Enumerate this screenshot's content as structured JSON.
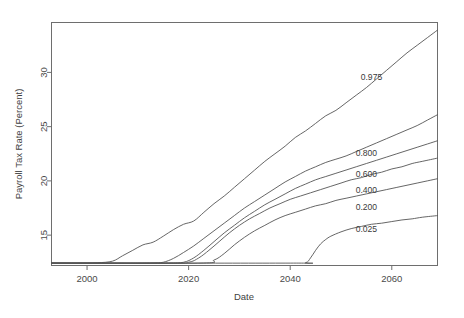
{
  "chart_data": {
    "type": "line",
    "title": "",
    "xlabel": "Date",
    "ylabel": "Payroll Tax Rate (Percent)",
    "xlim": [
      1993,
      2069
    ],
    "ylim": [
      12.2,
      34.6
    ],
    "xticks": [
      2000,
      2020,
      2040,
      2060
    ],
    "xticklabels": [
      "2000",
      "2020",
      "2040",
      "2060"
    ],
    "yticks": [
      15,
      20,
      25,
      30
    ],
    "yticklabels": [
      "15",
      "20",
      "25",
      "30"
    ],
    "grid": false,
    "legend": "inline-curve-labels",
    "series": [
      {
        "name": "0.975",
        "label": "0.975",
        "label_x": 2056,
        "label_y": 29.3,
        "x": [
          1993,
          1998,
          2002,
          2005,
          2007,
          2009,
          2011,
          2013,
          2015,
          2017,
          2019,
          2021,
          2023,
          2025,
          2027,
          2029,
          2031,
          2033,
          2035,
          2037,
          2039,
          2041,
          2043,
          2045,
          2047,
          2049,
          2051,
          2053,
          2055,
          2057,
          2059,
          2061,
          2063,
          2065,
          2067,
          2069
        ],
        "y": [
          12.42,
          12.42,
          12.45,
          12.6,
          13.1,
          13.6,
          14.1,
          14.35,
          14.9,
          15.5,
          16.0,
          16.3,
          17.1,
          17.9,
          18.6,
          19.4,
          20.2,
          21.0,
          21.8,
          22.5,
          23.2,
          24.0,
          24.6,
          25.3,
          26.0,
          26.5,
          27.2,
          27.9,
          28.6,
          29.4,
          30.2,
          31.0,
          31.8,
          32.5,
          33.2,
          33.9
        ]
      },
      {
        "name": "0.800",
        "label": "0.800",
        "label_x": 2055,
        "label_y": 22.3,
        "x": [
          1993,
          2005,
          2010,
          2013,
          2015,
          2017,
          2019,
          2021,
          2023,
          2025,
          2027,
          2029,
          2031,
          2033,
          2035,
          2037,
          2039,
          2041,
          2043,
          2045,
          2047,
          2049,
          2051,
          2053,
          2055,
          2057,
          2059,
          2061,
          2063,
          2065,
          2067,
          2069
        ],
        "y": [
          12.42,
          12.42,
          12.42,
          12.44,
          12.5,
          12.85,
          13.4,
          14.0,
          14.7,
          15.4,
          16.1,
          16.8,
          17.5,
          18.1,
          18.7,
          19.3,
          19.9,
          20.4,
          20.9,
          21.3,
          21.7,
          22.0,
          22.3,
          22.7,
          23.1,
          23.5,
          23.9,
          24.3,
          24.7,
          25.1,
          25.6,
          26.1
        ]
      },
      {
        "name": "0.600",
        "label": "0.600",
        "label_x": 2055,
        "label_y": 20.4,
        "x": [
          1993,
          2010,
          2016,
          2019,
          2021,
          2023,
          2025,
          2027,
          2029,
          2031,
          2033,
          2035,
          2037,
          2039,
          2041,
          2043,
          2045,
          2047,
          2049,
          2051,
          2053,
          2055,
          2057,
          2059,
          2061,
          2063,
          2065,
          2067,
          2069
        ],
        "y": [
          12.42,
          12.42,
          12.43,
          12.5,
          12.9,
          13.6,
          14.4,
          15.2,
          15.9,
          16.6,
          17.2,
          17.8,
          18.3,
          18.8,
          19.3,
          19.7,
          20.1,
          20.4,
          20.7,
          21.0,
          21.3,
          21.6,
          21.9,
          22.2,
          22.5,
          22.8,
          23.1,
          23.4,
          23.7
        ]
      },
      {
        "name": "0.400",
        "label": "0.400",
        "label_x": 2055,
        "label_y": 18.9,
        "x": [
          1993,
          2016,
          2020,
          2022,
          2024,
          2026,
          2028,
          2030,
          2032,
          2034,
          2036,
          2038,
          2040,
          2042,
          2044,
          2046,
          2048,
          2050,
          2052,
          2054,
          2056,
          2058,
          2060,
          2062,
          2064,
          2066,
          2069
        ],
        "y": [
          12.42,
          12.42,
          12.5,
          12.9,
          13.6,
          14.4,
          15.2,
          15.9,
          16.5,
          17.0,
          17.5,
          17.9,
          18.3,
          18.6,
          18.9,
          19.2,
          19.5,
          19.8,
          20.1,
          20.3,
          20.6,
          20.8,
          21.1,
          21.3,
          21.6,
          21.8,
          22.1
        ]
      },
      {
        "name": "0.200",
        "label": "0.200",
        "label_x": 2055,
        "label_y": 17.3,
        "x": [
          1993,
          2022,
          2025,
          2027,
          2029,
          2031,
          2033,
          2035,
          2037,
          2039,
          2041,
          2043,
          2045,
          2047,
          2049,
          2051,
          2053,
          2055,
          2057,
          2059,
          2061,
          2063,
          2065,
          2067,
          2069
        ],
        "y": [
          12.42,
          12.42,
          12.7,
          13.3,
          14.1,
          14.8,
          15.4,
          15.9,
          16.4,
          16.8,
          17.1,
          17.4,
          17.7,
          17.9,
          18.2,
          18.4,
          18.6,
          18.8,
          19.0,
          19.2,
          19.4,
          19.6,
          19.8,
          20.0,
          20.2
        ]
      },
      {
        "name": "0.025",
        "label": "0.025",
        "label_x": 2055,
        "label_y": 15.3,
        "x": [
          1993,
          2040,
          2043,
          2044,
          2045,
          2046,
          2047,
          2048,
          2050,
          2052,
          2054,
          2056,
          2058,
          2060,
          2062,
          2064,
          2066,
          2069
        ],
        "y": [
          12.42,
          12.42,
          12.45,
          12.9,
          13.6,
          14.2,
          14.6,
          14.9,
          15.3,
          15.6,
          15.8,
          16.0,
          16.1,
          16.25,
          16.4,
          16.5,
          16.65,
          16.8
        ]
      }
    ]
  }
}
